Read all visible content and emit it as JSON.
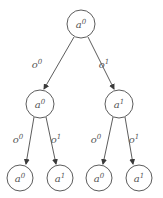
{
  "diagram": {
    "type": "tree",
    "colors": {
      "stroke": "#4a4a4a",
      "label": "#555555",
      "background": "#ffffff"
    },
    "nodes": [
      {
        "id": "root",
        "base": "a",
        "sup": "0",
        "cx": 81,
        "cy": 24,
        "r": 14
      },
      {
        "id": "mid-left",
        "base": "a",
        "sup": "0",
        "cx": 40,
        "cy": 104,
        "r": 14
      },
      {
        "id": "mid-right",
        "base": "a",
        "sup": "1",
        "cx": 119,
        "cy": 104,
        "r": 14
      },
      {
        "id": "leaf-1",
        "base": "a",
        "sup": "0",
        "cx": 20,
        "cy": 178,
        "r": 13
      },
      {
        "id": "leaf-2",
        "base": "a",
        "sup": "1",
        "cx": 60,
        "cy": 178,
        "r": 13
      },
      {
        "id": "leaf-3",
        "base": "a",
        "sup": "0",
        "cx": 99,
        "cy": 178,
        "r": 13
      },
      {
        "id": "leaf-4",
        "base": "a",
        "sup": "1",
        "cx": 139,
        "cy": 178,
        "r": 13
      }
    ],
    "edges": [
      {
        "from": "root",
        "to": "mid-left",
        "base": "o",
        "sup": "0",
        "x1": 74,
        "y1": 37,
        "x2": 44,
        "y2": 89,
        "lx": 37,
        "ly": 68
      },
      {
        "from": "root",
        "to": "mid-right",
        "base": "o",
        "sup": "1",
        "x1": 88,
        "y1": 37,
        "x2": 114,
        "y2": 89,
        "lx": 104,
        "ly": 68
      },
      {
        "from": "mid-left",
        "to": "leaf-1",
        "base": "o",
        "sup": "0",
        "x1": 34,
        "y1": 117,
        "x2": 26,
        "y2": 164,
        "lx": 18,
        "ly": 143
      },
      {
        "from": "mid-left",
        "to": "leaf-2",
        "base": "o",
        "sup": "1",
        "x1": 46,
        "y1": 117,
        "x2": 56,
        "y2": 164,
        "lx": 56,
        "ly": 143
      },
      {
        "from": "mid-right",
        "to": "leaf-3",
        "base": "o",
        "sup": "0",
        "x1": 113,
        "y1": 117,
        "x2": 103,
        "y2": 164,
        "lx": 96,
        "ly": 143
      },
      {
        "from": "mid-right",
        "to": "leaf-4",
        "base": "o",
        "sup": "1",
        "x1": 125,
        "y1": 117,
        "x2": 133,
        "y2": 164,
        "lx": 134,
        "ly": 143
      }
    ]
  }
}
